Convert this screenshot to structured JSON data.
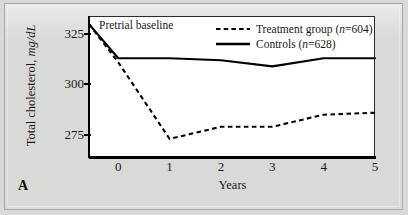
{
  "figure": {
    "panel_label": "A",
    "annotation": "Pretrial baseline",
    "background_color": "#d9d9d7",
    "plot_background_color": "#ffffff",
    "line_color": "#000000"
  },
  "legend": {
    "position": "top-right",
    "entries": [
      {
        "label_prefix": "Treatment group (",
        "n_symbol": "n",
        "n_value": "=604)",
        "style": "dashed"
      },
      {
        "label_prefix": "Controls (",
        "n_symbol": "n",
        "n_value": "=628)",
        "style": "solid"
      }
    ]
  },
  "axes": {
    "y_title_main": "Total cholesterol, ",
    "y_title_units": "mg/dL",
    "x_title": "Years",
    "y_ticks": [
      "325",
      "300",
      "275"
    ],
    "x_ticks": [
      "0",
      "1",
      "2",
      "3",
      "4",
      "5"
    ]
  },
  "chart_data": {
    "type": "line",
    "title": "",
    "subtitle": "",
    "xlabel": "Years",
    "ylabel": "Total cholesterol, mg/dL",
    "xlim": [
      -0.57,
      5
    ],
    "ylim": [
      264,
      334
    ],
    "ytick_values": [
      325,
      300,
      275
    ],
    "xtick_values": [
      0,
      1,
      2,
      3,
      4,
      5
    ],
    "grid": false,
    "legend_position": "top-right",
    "annotations": [
      {
        "text": "Pretrial baseline",
        "x": -0.35,
        "y": 331
      },
      {
        "text": "A",
        "x": -0.95,
        "y": 262
      }
    ],
    "x": [
      -0.57,
      0,
      1,
      2,
      3,
      4,
      5
    ],
    "x_labels": [
      "pretrial",
      "0",
      "1",
      "2",
      "3",
      "4",
      "5"
    ],
    "series": [
      {
        "name": "Treatment group (n=604)",
        "n": 604,
        "style": "dashed",
        "color": "#000000",
        "values": [
          330,
          311,
          273,
          279,
          279,
          285,
          286
        ]
      },
      {
        "name": "Controls (n=628)",
        "n": 628,
        "style": "solid",
        "color": "#000000",
        "values": [
          330,
          313,
          313,
          312,
          309,
          313,
          313
        ]
      }
    ]
  }
}
